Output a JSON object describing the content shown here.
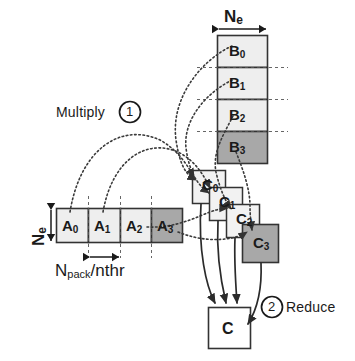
{
  "diagram": {
    "title_hidden": "",
    "colors": {
      "light_fill": "#eeeeee",
      "dark_fill": "#a8a8a8",
      "stroke": "#333333",
      "dotted": "#444444",
      "solid_arrow": "#2b2b2b",
      "text": "#1a1a1a",
      "background": "#ffffff"
    },
    "steps": [
      {
        "id": "step-1",
        "number": "1",
        "label": "Multiply"
      },
      {
        "id": "step-2",
        "number": "2",
        "label": "Reduce"
      }
    ],
    "dimension_labels": {
      "b_width": {
        "text": "N",
        "sub": "e"
      },
      "a_height": {
        "text": "N",
        "sub": "e"
      },
      "a_segment": {
        "text": "N",
        "sub": "pack",
        "divider": "/",
        "tail": "nthr"
      }
    },
    "b_matrix": {
      "name": "B",
      "orientation": "vertical",
      "blocks": [
        {
          "label": "B",
          "sub": "0",
          "shade": "light"
        },
        {
          "label": "B",
          "sub": "1",
          "shade": "light"
        },
        {
          "label": "B",
          "sub": "2",
          "shade": "light"
        },
        {
          "label": "B",
          "sub": "3",
          "shade": "dark"
        }
      ]
    },
    "a_matrix": {
      "name": "A",
      "orientation": "horizontal",
      "blocks": [
        {
          "label": "A",
          "sub": "0",
          "shade": "light"
        },
        {
          "label": "A",
          "sub": "1",
          "shade": "light"
        },
        {
          "label": "A",
          "sub": "2",
          "shade": "light"
        },
        {
          "label": "A",
          "sub": "3",
          "shade": "dark"
        }
      ]
    },
    "c_partials": [
      {
        "label": "C",
        "sub": "0",
        "shade": "light"
      },
      {
        "label": "C",
        "sub": "1",
        "shade": "light"
      },
      {
        "label": "C",
        "sub": "2",
        "shade": "light"
      },
      {
        "label": "C",
        "sub": "3",
        "shade": "dark"
      }
    ],
    "c_result": {
      "label": "C",
      "shade": "white"
    }
  }
}
